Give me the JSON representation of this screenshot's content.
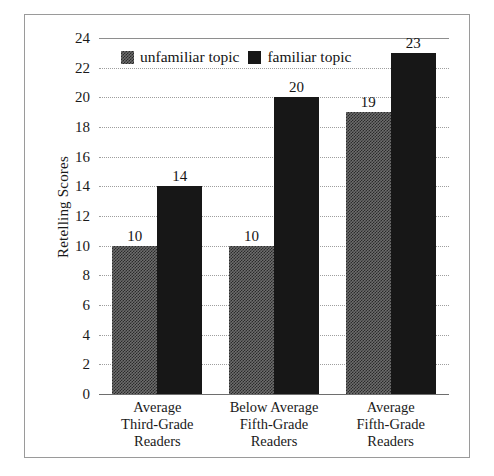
{
  "chart_data": {
    "type": "bar",
    "title": "",
    "xlabel": "",
    "ylabel": "Retelling Scores",
    "ylim": [
      0,
      24
    ],
    "ytick_step": 2,
    "yticks": [
      "24",
      "22",
      "20",
      "18",
      "16",
      "14",
      "12",
      "10",
      "8",
      "6",
      "4",
      "2",
      "0"
    ],
    "grid": "horizontal-dotted",
    "legend_position": "top-left-inside",
    "categories": [
      "Average\nThird-Grade\nReaders",
      "Below Average\nFifth-Grade\nReaders",
      "Average\nFifth-Grade\nReaders"
    ],
    "category_lines": [
      [
        "Average",
        "Third-Grade",
        "Readers"
      ],
      [
        "Below Average",
        "Fifth-Grade",
        "Readers"
      ],
      [
        "Average",
        "Fifth-Grade",
        "Readers"
      ]
    ],
    "series": [
      {
        "name": "unfamiliar topic",
        "color": "#6d6d6d",
        "values": [
          10,
          10,
          19
        ],
        "value_labels": [
          "10",
          "10",
          "19"
        ]
      },
      {
        "name": "familiar topic",
        "color": "#171717",
        "values": [
          14,
          20,
          23
        ],
        "value_labels": [
          "14",
          "20",
          "23"
        ]
      }
    ]
  },
  "legend": {
    "items": [
      {
        "label": "unfamiliar topic",
        "swatch": "unfamiliar"
      },
      {
        "label": "familiar topic",
        "swatch": "familiar"
      }
    ]
  },
  "axis": {
    "y_title": "Retelling Scores"
  }
}
